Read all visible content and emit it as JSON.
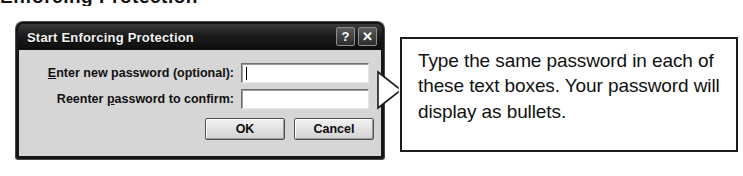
{
  "page": {
    "clipped_heading": "Enforcing Protection"
  },
  "dialog": {
    "title": "Start Enforcing Protection",
    "titlebar_buttons": [
      {
        "name": "help-button",
        "glyph": "?"
      },
      {
        "name": "close-button",
        "glyph": "✕"
      }
    ],
    "fields": [
      {
        "label_before": "E",
        "label_accel": "E",
        "label_full": "Enter new password (optional):",
        "label_rest": "nter new password (optional):",
        "value": "",
        "has_caret": true
      },
      {
        "label_accel": "p",
        "label_full": "Reenter password to confirm:",
        "label_pre": "Reenter ",
        "label_rest": "assword to confirm:",
        "value": "",
        "has_caret": false
      }
    ],
    "buttons": {
      "ok": "OK",
      "cancel": "Cancel"
    }
  },
  "callout": {
    "text": "Type the same password in each of these text boxes. Your password will display as bullets.",
    "arrow_direction": "left"
  },
  "colors": {
    "titlebar": "#151515",
    "dialog_body": "#d6d6d6",
    "dialog_border": "#161616",
    "field_background": "#ffffff",
    "callout_border": "#1c1c1c",
    "text": "#111111"
  }
}
